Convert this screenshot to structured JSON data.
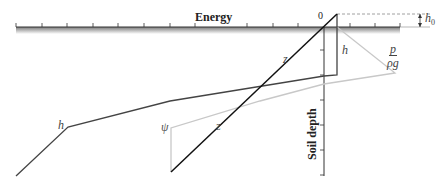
{
  "diagram": {
    "axes": {
      "horizontal_label": "Energy",
      "vertical_label": "Soil depth",
      "origin_label": "0"
    },
    "labels": {
      "h0": "h",
      "h0_sub": "0",
      "h_upper": "h",
      "h_lower": "h",
      "pressure_num": "p",
      "pressure_den": "ρg",
      "psi": "ψ",
      "z_upper": "z",
      "z_lower": "z"
    },
    "colors": {
      "z_line": "#111111",
      "h_line": "#444444",
      "pressure_line": "#c8c8c8",
      "axis": "#333333",
      "dashed": "#888888"
    },
    "series": [
      {
        "name": "z (gravitational head)",
        "style": "black"
      },
      {
        "name": "h (total head)",
        "style": "dark gray"
      },
      {
        "name": "p/ρg, ψ (pressure head)",
        "style": "light gray"
      }
    ]
  }
}
